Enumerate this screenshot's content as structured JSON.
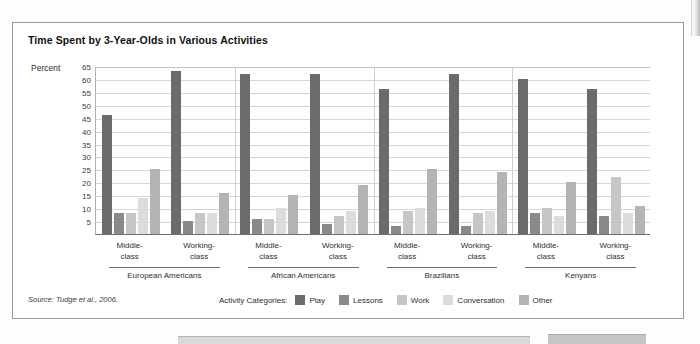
{
  "figure": {
    "title": "Time Spent by 3-Year-Olds in Various Activities",
    "source": "Source: Tudge et al., 2006.",
    "legend_title": "Activity Categories:"
  },
  "axis": {
    "y_title": "Percent",
    "y_ticks": [
      65,
      60,
      55,
      50,
      45,
      40,
      35,
      30,
      25,
      20,
      15,
      10,
      5
    ]
  },
  "colors": {
    "play": "#6b6b6b",
    "lessons": "#8a8a8a",
    "work": "#c6c6c6",
    "conversation": "#dcdcdc",
    "other": "#b4b4b4",
    "gridline": "#d6d6d6",
    "axis": "#6e6e6e",
    "frame": "#9a9a9a",
    "text": "#2e2e2e"
  },
  "chart_data": {
    "type": "bar",
    "title": "Time Spent by 3-Year-Olds in Various Activities",
    "xlabel": "",
    "ylabel": "Percent",
    "ylim": [
      0,
      65
    ],
    "ytick_step": 5,
    "grid": true,
    "legend_position": "bottom",
    "legend": [
      "Play",
      "Lessons",
      "Work",
      "Conversation",
      "Other"
    ],
    "series": [
      {
        "name": "Play",
        "values": [
          46,
          63,
          62,
          62,
          56,
          62,
          60,
          56
        ]
      },
      {
        "name": "Lessons",
        "values": [
          8,
          5,
          6,
          4,
          3,
          3,
          8,
          7
        ]
      },
      {
        "name": "Work",
        "values": [
          8,
          8,
          6,
          7,
          9,
          8,
          10,
          22
        ]
      },
      {
        "name": "Conversation",
        "values": [
          14,
          8,
          10,
          9,
          10,
          9,
          7,
          8
        ]
      },
      {
        "name": "Other",
        "values": [
          25,
          16,
          15,
          19,
          25,
          24,
          20,
          11
        ]
      }
    ],
    "categories": [
      "European Americans Middle-class",
      "European Americans Working-class",
      "African Americans Middle-class",
      "African Americans Working-class",
      "Brazilians Middle-class",
      "Brazilians Working-class",
      "Kenyans Middle-class",
      "Kenyans Working-class"
    ],
    "groups": [
      {
        "culture": "European Americans",
        "classes": [
          {
            "label_line1": "Middle-",
            "label_line2": "class",
            "values": {
              "Play": 46,
              "Lessons": 8,
              "Work": 8,
              "Conversation": 14,
              "Other": 25
            }
          },
          {
            "label_line1": "Working-",
            "label_line2": "class",
            "values": {
              "Play": 63,
              "Lessons": 5,
              "Work": 8,
              "Conversation": 8,
              "Other": 16
            }
          }
        ]
      },
      {
        "culture": "African Americans",
        "classes": [
          {
            "label_line1": "Middle-",
            "label_line2": "class",
            "values": {
              "Play": 62,
              "Lessons": 6,
              "Work": 6,
              "Conversation": 10,
              "Other": 15
            }
          },
          {
            "label_line1": "Working-",
            "label_line2": "class",
            "values": {
              "Play": 62,
              "Lessons": 4,
              "Work": 7,
              "Conversation": 9,
              "Other": 19
            }
          }
        ]
      },
      {
        "culture": "Brazilians",
        "classes": [
          {
            "label_line1": "Middle-",
            "label_line2": "class",
            "values": {
              "Play": 56,
              "Lessons": 3,
              "Work": 9,
              "Conversation": 10,
              "Other": 25
            }
          },
          {
            "label_line1": "Working-",
            "label_line2": "class",
            "values": {
              "Play": 62,
              "Lessons": 3,
              "Work": 8,
              "Conversation": 9,
              "Other": 24
            }
          }
        ]
      },
      {
        "culture": "Kenyans",
        "classes": [
          {
            "label_line1": "Middle-",
            "label_line2": "class",
            "values": {
              "Play": 60,
              "Lessons": 8,
              "Work": 10,
              "Conversation": 7,
              "Other": 20
            }
          },
          {
            "label_line1": "Working-",
            "label_line2": "class",
            "values": {
              "Play": 56,
              "Lessons": 7,
              "Work": 22,
              "Conversation": 8,
              "Other": 11
            }
          }
        ]
      }
    ]
  }
}
